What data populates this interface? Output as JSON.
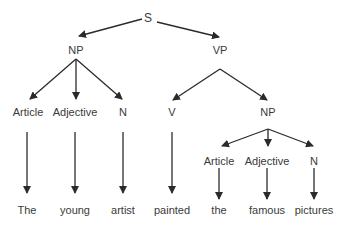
{
  "diagram": {
    "type": "parse-tree",
    "colors": {
      "line": "#2b2b2b",
      "text": "#3a3a3a",
      "background": "#ffffff"
    },
    "nodes": {
      "s": {
        "label": "S",
        "x": 148,
        "y": 18
      },
      "np1": {
        "label": "NP",
        "x": 76,
        "y": 50
      },
      "vp": {
        "label": "VP",
        "x": 220,
        "y": 50
      },
      "art1": {
        "label": "Article",
        "x": 28,
        "y": 112
      },
      "adj1": {
        "label": "Adjective",
        "x": 75,
        "y": 112
      },
      "n1": {
        "label": "N",
        "x": 123,
        "y": 112
      },
      "v": {
        "label": "V",
        "x": 172,
        "y": 112
      },
      "np2": {
        "label": "NP",
        "x": 268,
        "y": 112
      },
      "art2": {
        "label": "Article",
        "x": 219,
        "y": 161
      },
      "adj2": {
        "label": "Adjective",
        "x": 267,
        "y": 161
      },
      "n2": {
        "label": "N",
        "x": 314,
        "y": 161
      }
    },
    "words": [
      {
        "text": "The",
        "x": 27,
        "y": 210
      },
      {
        "text": "young",
        "x": 75,
        "y": 210
      },
      {
        "text": "artist",
        "x": 123,
        "y": 210
      },
      {
        "text": "painted",
        "x": 172,
        "y": 210
      },
      {
        "text": "the",
        "x": 219,
        "y": 210
      },
      {
        "text": "famous",
        "x": 267,
        "y": 210
      },
      {
        "text": "pictures",
        "x": 314,
        "y": 210
      }
    ],
    "edges": [
      {
        "from": "S",
        "to": "NP",
        "x1": 142,
        "y1": 19,
        "x2": 79,
        "y2": 36
      },
      {
        "from": "S",
        "to": "VP",
        "x1": 157,
        "y1": 22,
        "x2": 219,
        "y2": 37
      },
      {
        "from": "NP",
        "to": "Article",
        "x1": 76,
        "y1": 59,
        "x2": 30,
        "y2": 99
      },
      {
        "from": "NP",
        "to": "Adjective",
        "x1": 76,
        "y1": 59,
        "x2": 76,
        "y2": 99
      },
      {
        "from": "NP",
        "to": "N",
        "x1": 76,
        "y1": 59,
        "x2": 122,
        "y2": 99
      },
      {
        "from": "VP",
        "to": "V",
        "x1": 220,
        "y1": 69,
        "x2": 173,
        "y2": 100
      },
      {
        "from": "VP",
        "to": "NP",
        "x1": 220,
        "y1": 69,
        "x2": 267,
        "y2": 100
      },
      {
        "from": "Article",
        "to": "The",
        "x1": 27,
        "y1": 132,
        "x2": 27,
        "y2": 193
      },
      {
        "from": "Adjective",
        "to": "young",
        "x1": 75,
        "y1": 132,
        "x2": 75,
        "y2": 193
      },
      {
        "from": "N",
        "to": "artist",
        "x1": 123,
        "y1": 132,
        "x2": 123,
        "y2": 193
      },
      {
        "from": "V",
        "to": "painted",
        "x1": 172,
        "y1": 132,
        "x2": 172,
        "y2": 193
      },
      {
        "from": "NP",
        "to": "Article",
        "x1": 268,
        "y1": 129,
        "x2": 222,
        "y2": 146
      },
      {
        "from": "NP",
        "to": "Adjective",
        "x1": 268,
        "y1": 129,
        "x2": 268,
        "y2": 146
      },
      {
        "from": "NP",
        "to": "N",
        "x1": 268,
        "y1": 129,
        "x2": 313,
        "y2": 146
      },
      {
        "from": "Article",
        "to": "the",
        "x1": 219,
        "y1": 168,
        "x2": 219,
        "y2": 199
      },
      {
        "from": "Adjective",
        "to": "famous",
        "x1": 267,
        "y1": 168,
        "x2": 267,
        "y2": 199
      },
      {
        "from": "N",
        "to": "pictures",
        "x1": 314,
        "y1": 168,
        "x2": 314,
        "y2": 199
      }
    ]
  }
}
